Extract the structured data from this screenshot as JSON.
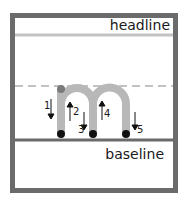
{
  "labels": {
    "headline": "headline",
    "baseline": "baseline"
  },
  "strokes": [
    {
      "number": "1",
      "direction": "down"
    },
    {
      "number": "2",
      "direction": "up"
    },
    {
      "number": "3",
      "direction": "down"
    },
    {
      "number": "4",
      "direction": "up"
    },
    {
      "number": "5",
      "direction": "down"
    }
  ],
  "letter": "m",
  "colors": {
    "frame": "#6b6b6b",
    "guide_line": "#c2c2c2",
    "letter_stroke": "#b8b8b8",
    "start_dot": "#7a7a7a",
    "end_dot": "#111111"
  }
}
